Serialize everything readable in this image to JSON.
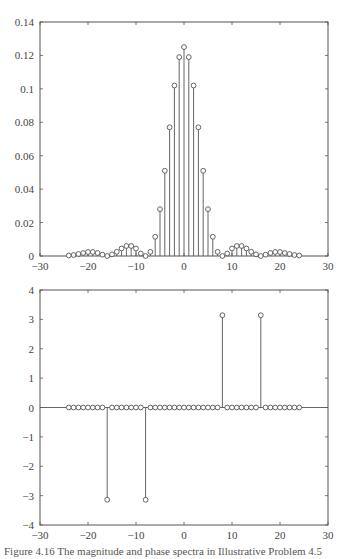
{
  "chart_data": [
    {
      "type": "stem",
      "title": "",
      "xlabel": "",
      "ylabel": "",
      "xlim": [
        -30,
        30
      ],
      "ylim": [
        0,
        0.14
      ],
      "xticks": [
        -30,
        -20,
        -10,
        0,
        10,
        20,
        30
      ],
      "xtick_labels": [
        "-30",
        "-20",
        "-10",
        "0",
        "10",
        "20",
        "30"
      ],
      "yticks": [
        0,
        0.02,
        0.04,
        0.06,
        0.08,
        0.1,
        0.12,
        0.14
      ],
      "ytick_labels": [
        "0",
        "0.02",
        "0.04",
        "0.06",
        "0.08",
        "0.1",
        "0.12",
        "0.14"
      ],
      "grid": false,
      "marker": "circle",
      "x": [
        -24,
        -23,
        -22,
        -21,
        -20,
        -19,
        -18,
        -17,
        -16,
        -15,
        -14,
        -13,
        -12,
        -11,
        -10,
        -9,
        -8,
        -7,
        -6,
        -5,
        -4,
        -3,
        -2,
        -1,
        0,
        1,
        2,
        3,
        4,
        5,
        6,
        7,
        8,
        9,
        10,
        11,
        12,
        13,
        14,
        15,
        16,
        17,
        18,
        19,
        20,
        21,
        22,
        23,
        24
      ],
      "values": [
        0.0003,
        0.0006,
        0.0012,
        0.0018,
        0.0024,
        0.0024,
        0.0018,
        0.0008,
        0.0,
        0.001,
        0.0025,
        0.0045,
        0.006,
        0.006,
        0.0045,
        0.0015,
        0.0,
        0.0025,
        0.0115,
        0.028,
        0.051,
        0.077,
        0.102,
        0.119,
        0.125,
        0.119,
        0.102,
        0.077,
        0.051,
        0.028,
        0.0115,
        0.0025,
        0.0,
        0.0015,
        0.0045,
        0.006,
        0.006,
        0.0045,
        0.0025,
        0.001,
        0.0,
        0.0008,
        0.0018,
        0.0024,
        0.0024,
        0.0018,
        0.0012,
        0.0006,
        0.0003
      ]
    },
    {
      "type": "stem",
      "title": "",
      "xlabel": "",
      "ylabel": "",
      "xlim": [
        -30,
        30
      ],
      "ylim": [
        -4,
        4
      ],
      "xticks": [
        -30,
        -20,
        -10,
        0,
        10,
        20,
        30
      ],
      "xtick_labels": [
        "-30",
        "-20",
        "-10",
        "0",
        "10",
        "20",
        "30"
      ],
      "yticks": [
        -4,
        -3,
        -2,
        -1,
        0,
        1,
        2,
        3,
        4
      ],
      "ytick_labels": [
        "-4",
        "-3",
        "-2",
        "-1",
        "0",
        "1",
        "2",
        "3",
        "4"
      ],
      "grid": false,
      "marker": "circle",
      "x": [
        -24,
        -23,
        -22,
        -21,
        -20,
        -19,
        -18,
        -17,
        -16,
        -15,
        -14,
        -13,
        -12,
        -11,
        -10,
        -9,
        -8,
        -7,
        -6,
        -5,
        -4,
        -3,
        -2,
        -1,
        0,
        1,
        2,
        3,
        4,
        5,
        6,
        7,
        8,
        9,
        10,
        11,
        12,
        13,
        14,
        15,
        16,
        17,
        18,
        19,
        20,
        21,
        22,
        23,
        24
      ],
      "values": [
        0,
        0,
        0,
        0,
        0,
        0,
        0,
        0,
        -3.1416,
        0,
        0,
        0,
        0,
        0,
        0,
        0,
        -3.1416,
        0,
        0,
        0,
        0,
        0,
        0,
        0,
        0,
        0,
        0,
        0,
        0,
        0,
        0,
        0,
        3.1416,
        0,
        0,
        0,
        0,
        0,
        0,
        0,
        3.1416,
        0,
        0,
        0,
        0,
        0,
        0,
        0,
        0
      ]
    }
  ],
  "plots": [
    {
      "box": {
        "left": 40,
        "top": 22,
        "right": 328,
        "bottom": 256
      }
    },
    {
      "box": {
        "left": 40,
        "top": 290,
        "right": 328,
        "bottom": 525
      }
    }
  ],
  "colors": {
    "axis": "#555555",
    "stem": "#555555",
    "marker_stroke": "#555555",
    "marker_fill": "#ffffff",
    "text": "#444444"
  },
  "caption": "Figure 4.16  The magnitude and phase spectra in Illustrative Problem 4.5"
}
